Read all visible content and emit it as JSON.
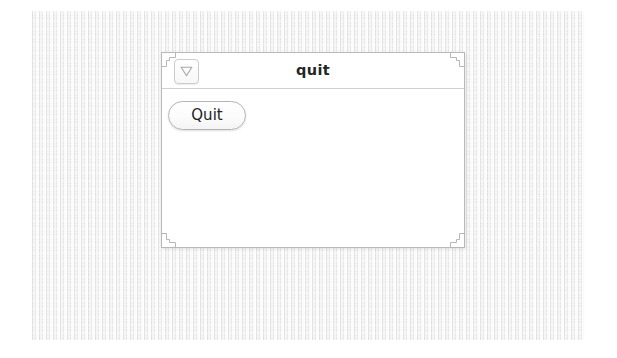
{
  "desktop": {
    "background_color": "#ececec",
    "texture": "woven-linen"
  },
  "window": {
    "title": "quit",
    "background_color": "#ffffff",
    "border_color": "#b9b9b9",
    "titlebar": {
      "menu_button": {
        "icon": "triangle-down-icon",
        "tooltip": "Window menu"
      }
    },
    "content": {
      "buttons": [
        {
          "label": "Quit",
          "name": "quit-button"
        }
      ]
    },
    "resize_handles": [
      "top-left",
      "top-right",
      "bottom-left",
      "bottom-right"
    ]
  }
}
